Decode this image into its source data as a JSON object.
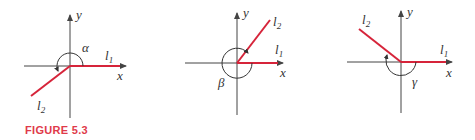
{
  "caption": "FIGURE 5.3",
  "colors": {
    "line": "#d6243a",
    "axis": "#444444",
    "caption": "#e03a4a"
  },
  "panels": [
    {
      "axis_x": "x",
      "axis_y": "y",
      "line1": "l",
      "line1_sub": "1",
      "line2": "l",
      "line2_sub": "2",
      "angle": "α"
    },
    {
      "axis_x": "x",
      "axis_y": "y",
      "line1": "l",
      "line1_sub": "1",
      "line2": "l",
      "line2_sub": "2",
      "angle": "β"
    },
    {
      "axis_x": "x",
      "axis_y": "y",
      "line1": "l",
      "line1_sub": "1",
      "line2": "l",
      "line2_sub": "2",
      "angle": "γ"
    }
  ]
}
